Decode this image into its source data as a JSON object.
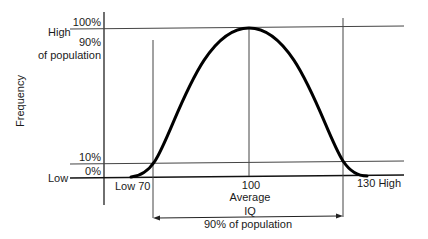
{
  "diagram": {
    "y_axis": {
      "label": "Frequency",
      "high_label": "High",
      "low_label": "Low",
      "pct_100": "100%",
      "pct_90_line1": "90%",
      "pct_90_line2": "of population",
      "pct_10": "10%",
      "pct_0": "0%"
    },
    "x_axis": {
      "low_label": "Low 70",
      "avg_value": "100",
      "avg_label": "Average",
      "high_label": "130 High",
      "iq_label": "IQ",
      "range_label": "90% of population"
    },
    "colors": {
      "line": "#1a1a1a",
      "curve": "#000000",
      "background": "#ffffff"
    }
  }
}
